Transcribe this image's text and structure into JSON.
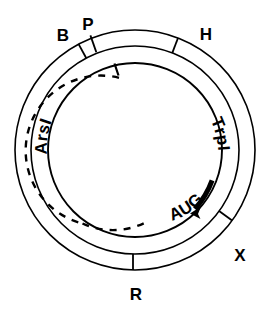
{
  "diagram": {
    "type": "plasmid-map",
    "title": "",
    "geometry": {
      "center_x": 135,
      "center_y": 150,
      "radius_outer": 120,
      "radius_middle": 104,
      "radius_inner": 87,
      "radius_dashed": 73
    },
    "colors": {
      "stroke": "#000000",
      "background": "#ffffff"
    },
    "restriction_sites": [
      {
        "label": "B",
        "angle_deg": -62,
        "label_x": 63,
        "label_y": 35
      },
      {
        "label": "P",
        "angle_deg": -52,
        "label_x": 88,
        "label_y": 27
      },
      {
        "label": "H",
        "angle_deg": -21,
        "label_x": 205,
        "label_y": 36
      },
      {
        "label": "X",
        "angle_deg": 54,
        "label_x": 238,
        "label_y": 257
      },
      {
        "label": "R",
        "angle_deg": 91,
        "label_x": 136,
        "label_y": 297
      }
    ],
    "features": [
      {
        "label": "ArsI",
        "kind": "dashed-arc-label",
        "start_deg": -20,
        "end_deg": 108
      },
      {
        "label": "TrpI",
        "kind": "inner-arc-label",
        "start_deg": 5,
        "end_deg": 50
      },
      {
        "label": "AUG",
        "kind": "start-codon-arc",
        "start_deg": 43,
        "end_deg": 64
      }
    ],
    "markers": [
      {
        "name": "origin-tick",
        "angle_deg": -13
      },
      {
        "name": "aug-arrowhead",
        "angle_deg": 43
      }
    ]
  }
}
